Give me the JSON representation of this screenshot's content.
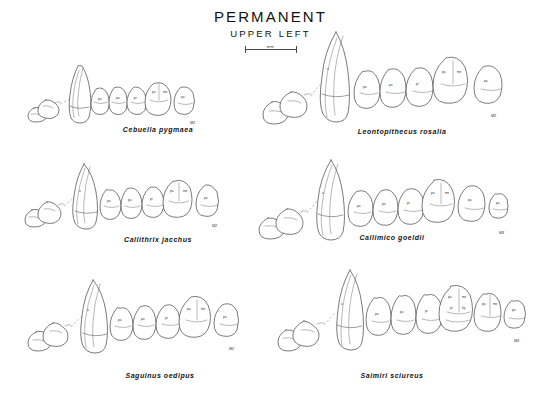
{
  "plate": {
    "title": "PERMANENT",
    "subtitle": "UPPER LEFT",
    "scale": {
      "label": "mm"
    }
  },
  "panels": [
    {
      "id": "cebuella-pygmaea",
      "caption": "Cebuella pygmaea",
      "column": "left",
      "row": 1,
      "teeth": [
        "I1",
        "I2",
        "C",
        "P2",
        "P3",
        "P4",
        "M1",
        "M2"
      ],
      "terminal_label": "M2"
    },
    {
      "id": "callithrix-jacchus",
      "caption": "Callithrix jacchus",
      "column": "left",
      "row": 2,
      "teeth": [
        "I1",
        "I2",
        "C",
        "P2",
        "P3",
        "P4",
        "M1",
        "M2"
      ],
      "terminal_label": "M2"
    },
    {
      "id": "saguinus-oedipus",
      "caption": "Saguinus oedipus",
      "column": "left",
      "row": 3,
      "teeth": [
        "I1",
        "I2",
        "C",
        "P2",
        "P3",
        "P4",
        "M1",
        "M2"
      ],
      "terminal_label": "M2"
    },
    {
      "id": "leontopithecus-rosalia",
      "caption": "Leontopithecus rosalia",
      "column": "right",
      "row": 1,
      "teeth": [
        "I1",
        "I2",
        "C",
        "P2",
        "P3",
        "P4",
        "M1",
        "M2"
      ],
      "terminal_label": "M2"
    },
    {
      "id": "callimico-goeldii",
      "caption": "Callimico goeldii",
      "column": "right",
      "row": 2,
      "teeth": [
        "I1",
        "I2",
        "C",
        "P2",
        "P3",
        "P4",
        "M1",
        "M2",
        "M3"
      ],
      "terminal_label": "M3"
    },
    {
      "id": "saimiri-sciureus",
      "caption": "Saimiri sciureus",
      "column": "right",
      "row": 3,
      "teeth": [
        "I1",
        "I2",
        "C",
        "P2",
        "P3",
        "P4",
        "M1",
        "M2",
        "M3"
      ],
      "terminal_label": "M3"
    }
  ],
  "colors": {
    "background": "#ffffff",
    "ink": "#4f4f4f",
    "text": "#141414"
  }
}
